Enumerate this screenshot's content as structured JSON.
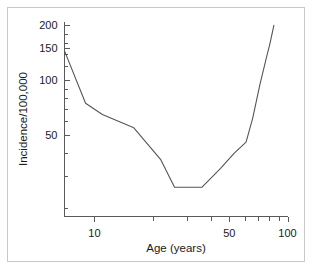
{
  "chart_data": {
    "type": "line",
    "title": "",
    "xlabel": "Age (years)",
    "ylabel": "Incidence/100,000",
    "xscale": "log",
    "yscale": "log",
    "xlim": [
      7,
      100
    ],
    "ylim": [
      18,
      210
    ],
    "grid": false,
    "legend": null,
    "xticks_major": [
      10,
      50,
      100
    ],
    "xtick_labels": [
      "10",
      "50",
      "100"
    ],
    "xticks_minor": [
      20,
      30,
      40,
      60,
      70,
      80,
      90
    ],
    "yticks_major": [
      50,
      100,
      150,
      200
    ],
    "ytick_labels": [
      "50",
      "100",
      "150",
      "200"
    ],
    "yticks_minor": [
      20,
      30,
      40,
      60,
      70,
      80,
      90,
      120,
      140,
      160,
      180
    ],
    "series": [
      {
        "name": "incidence",
        "x": [
          7,
          9,
          11,
          16,
          22,
          26,
          36,
          45,
          53,
          61,
          66,
          72,
          78,
          81,
          85
        ],
        "y": [
          145,
          75,
          65,
          55,
          37,
          26,
          26,
          33,
          40,
          46,
          62,
          95,
          135,
          158,
          200
        ]
      }
    ]
  },
  "axes": {
    "y_axis_title": "Incidence/100,000",
    "x_axis_title": "Age (years)"
  }
}
